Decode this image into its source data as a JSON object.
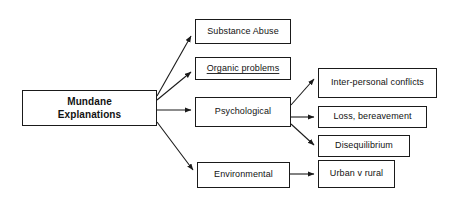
{
  "diagram": {
    "type": "hierarchy-flowchart",
    "title": "Mundane Explanations",
    "background_color": "#ffffff",
    "line_color": "#1a1a1a",
    "text_color": "#121212",
    "root": {
      "id": "mundane-explanations",
      "label": "Mundane\nExplanations",
      "bold": true
    },
    "level2": [
      {
        "id": "substance-abuse",
        "label": "Substance Abuse",
        "underlined": false
      },
      {
        "id": "organic-problems",
        "label": "Organic problems",
        "underlined": true
      },
      {
        "id": "psychological",
        "label": "Psychological",
        "underlined": false
      },
      {
        "id": "environmental",
        "label": "Environmental",
        "underlined": false
      }
    ],
    "level3": [
      {
        "id": "inter-personal-conflicts",
        "label": "Inter-personal conflicts",
        "parent": "psychological"
      },
      {
        "id": "loss-bereavement",
        "label": "Loss, bereavement",
        "parent": "psychological"
      },
      {
        "id": "disequilibrium",
        "label": "Disequilibrium",
        "parent": "psychological"
      },
      {
        "id": "urban-v-rural",
        "label": "Urban v rural",
        "parent": "environmental"
      }
    ],
    "edges": [
      {
        "from": "mundane-explanations",
        "to": "substance-abuse"
      },
      {
        "from": "mundane-explanations",
        "to": "organic-problems"
      },
      {
        "from": "mundane-explanations",
        "to": "psychological"
      },
      {
        "from": "mundane-explanations",
        "to": "environmental"
      },
      {
        "from": "psychological",
        "to": "inter-personal-conflicts"
      },
      {
        "from": "psychological",
        "to": "loss-bereavement"
      },
      {
        "from": "psychological",
        "to": "disequilibrium"
      },
      {
        "from": "environmental",
        "to": "urban-v-rural"
      }
    ]
  }
}
